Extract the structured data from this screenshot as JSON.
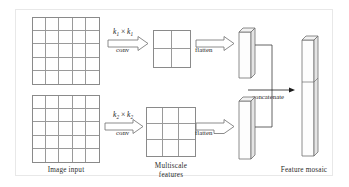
{
  "figure": {
    "background_color": "#ffffff",
    "border_color": "#e8e8e8",
    "stroke_color": "#6f6f6f",
    "text_color": "#2b2b2b"
  },
  "captions": {
    "image_input": "Image input",
    "multiscale_line1": "Multiscale",
    "multiscale_line2": "features",
    "feature_mosaic": "Feature mosaic"
  },
  "branches": {
    "top": {
      "input_grid": {
        "rows": 5,
        "cols": 5
      },
      "conv_kernel_base": "k",
      "conv_kernel_sub": "1",
      "conv_times": "×",
      "conv_label": "conv",
      "feature_grid": {
        "rows": 2,
        "cols": 2
      },
      "flatten_label": "flatten",
      "vector_name": "top-feature-vector"
    },
    "bottom": {
      "input_grid": {
        "rows": 5,
        "cols": 5
      },
      "conv_kernel_base": "k",
      "conv_kernel_sub": "2",
      "conv_times": "×",
      "conv_label": "conv",
      "feature_grid": {
        "rows": 3,
        "cols": 3
      },
      "flatten_label": "flatten",
      "vector_name": "bottom-feature-vector"
    }
  },
  "merge": {
    "concatenate_label": "concatenate",
    "output_vector_name": "feature-mosaic-vector",
    "output_segments": 2
  }
}
